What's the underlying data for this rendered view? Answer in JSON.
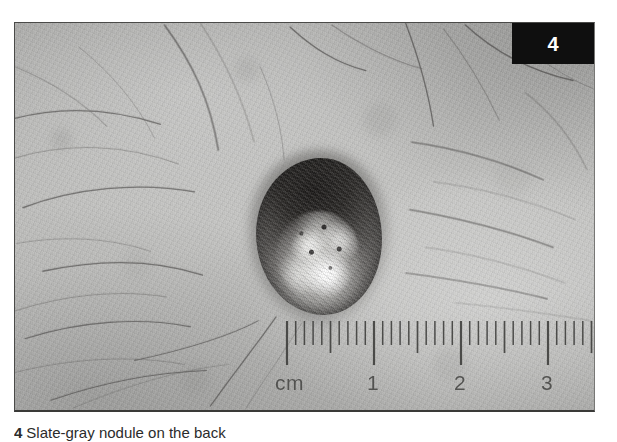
{
  "figure": {
    "number": "4",
    "badge_number": "4",
    "caption_number": "4",
    "caption_text": "Slate-gray nodule on the back",
    "alt": "Clinical photograph of a dark pigmented nodular skin lesion with a ruler showing centimetre scale"
  },
  "photo": {
    "subject": "pigmented-skin-lesion",
    "background": "hair-bearing-skin",
    "lesion": {
      "name": "nodule",
      "shape": "oval",
      "color_rim": "#2b2927",
      "color_center": "#d6d6d3",
      "approx_width_cm": "1.4",
      "approx_height_cm": "1.7"
    }
  },
  "ruler": {
    "unit_label": "cm",
    "tick_labels": [
      "cm",
      "1",
      "2",
      "3"
    ],
    "label_positions_px": [
      24,
      115,
      203,
      290
    ],
    "major_tick_cm": [
      0,
      1,
      2,
      3
    ],
    "minor_ticks_per_cm": 10,
    "pixels_per_cm": 87,
    "origin_px": 32,
    "tick_color": "#3c3c3a"
  },
  "colors": {
    "page_background": "#ffffff",
    "photo_border": "#3a3a38",
    "badge_background": "#0f0f0f",
    "badge_text": "#ffffff",
    "skin_light": "#c4c4c2",
    "skin_mid": "#b9b9b7",
    "skin_dark": "#a8a8a6",
    "caption_text": "#2b2b2b"
  }
}
